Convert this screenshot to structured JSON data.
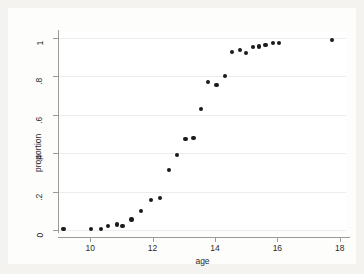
{
  "figure": {
    "background_color": "#f4f3f0",
    "graph_region_color": "#fdfdfc",
    "plot_area_color": "#ffffff",
    "axis_color": "#9a9a9a",
    "grid_color": "#ececec",
    "marker_color": "#1a1a1a"
  },
  "chart_data": {
    "type": "scatter",
    "title": "",
    "xlabel": "age",
    "ylabel": "proportion",
    "xlim": [
      9.0,
      18.2
    ],
    "ylim": [
      0,
      1.03
    ],
    "xticks": [
      10,
      12,
      14,
      16,
      18
    ],
    "xtick_labels": [
      "10",
      "12",
      "14",
      "16",
      "18"
    ],
    "yticks": [
      0,
      0.2,
      0.4,
      0.6,
      0.8,
      1
    ],
    "ytick_labels": [
      "0",
      ".2",
      ".4",
      ".6",
      ".8",
      "1"
    ],
    "grid": "horizontal",
    "legend": null,
    "marker": "filled-circle",
    "marker_size": 4.4,
    "points": [
      {
        "x": 9.15,
        "y": 0.005
      },
      {
        "x": 10.02,
        "y": 0.005
      },
      {
        "x": 10.34,
        "y": 0.005
      },
      {
        "x": 10.57,
        "y": 0.02
      },
      {
        "x": 10.85,
        "y": 0.028
      },
      {
        "x": 11.04,
        "y": 0.022
      },
      {
        "x": 11.33,
        "y": 0.055
      },
      {
        "x": 11.63,
        "y": 0.1
      },
      {
        "x": 11.95,
        "y": 0.155
      },
      {
        "x": 12.24,
        "y": 0.165
      },
      {
        "x": 12.52,
        "y": 0.312
      },
      {
        "x": 12.78,
        "y": 0.39
      },
      {
        "x": 13.05,
        "y": 0.475
      },
      {
        "x": 13.31,
        "y": 0.478
      },
      {
        "x": 13.55,
        "y": 0.63
      },
      {
        "x": 13.78,
        "y": 0.77
      },
      {
        "x": 14.05,
        "y": 0.755
      },
      {
        "x": 14.33,
        "y": 0.8
      },
      {
        "x": 14.55,
        "y": 0.925
      },
      {
        "x": 14.8,
        "y": 0.935
      },
      {
        "x": 15.0,
        "y": 0.922
      },
      {
        "x": 15.22,
        "y": 0.952
      },
      {
        "x": 15.42,
        "y": 0.955
      },
      {
        "x": 15.62,
        "y": 0.962
      },
      {
        "x": 15.85,
        "y": 0.972
      },
      {
        "x": 16.05,
        "y": 0.972
      },
      {
        "x": 17.75,
        "y": 0.99
      }
    ]
  }
}
